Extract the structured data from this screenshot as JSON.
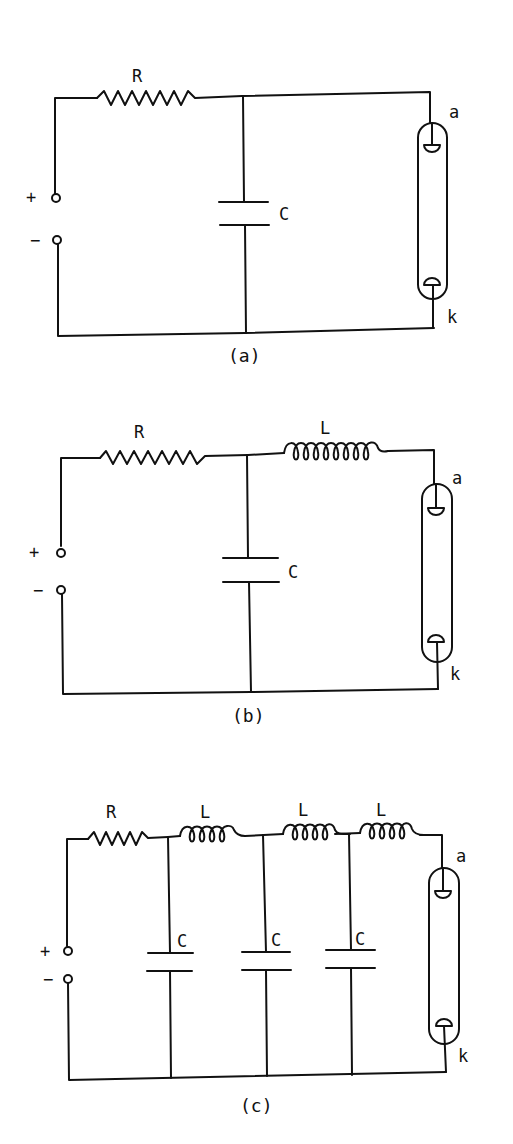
{
  "diagrams": [
    {
      "caption": "(a)",
      "resistor_label": "R",
      "capacitor_label": "C",
      "terminal_plus": "+",
      "terminal_minus": "−",
      "tube_anode_label": "a",
      "tube_cathode_label": "k"
    },
    {
      "caption": "(b)",
      "resistor_label": "R",
      "inductor_label": "L",
      "capacitor_label": "C",
      "terminal_plus": "+",
      "terminal_minus": "−",
      "tube_anode_label": "a",
      "tube_cathode_label": "k"
    },
    {
      "caption": "(c)",
      "resistor_label": "R",
      "inductor_labels": [
        "L",
        "L",
        "L"
      ],
      "capacitor_labels": [
        "C",
        "C",
        "C"
      ],
      "terminal_plus": "+",
      "terminal_minus": "−",
      "tube_anode_label": "a",
      "tube_cathode_label": "k"
    }
  ],
  "colors": {
    "ink": "#111111",
    "background": "#ffffff"
  }
}
